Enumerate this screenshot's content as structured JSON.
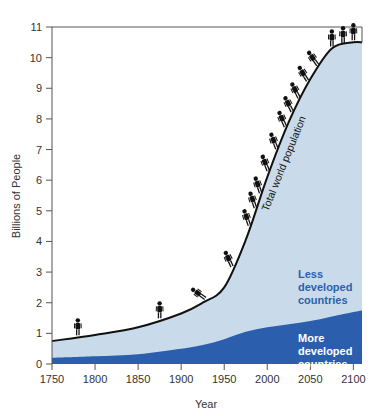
{
  "chart_data": {
    "type": "area",
    "title": "",
    "xlabel": "Year",
    "ylabel": "Billions of People",
    "xlim": [
      1750,
      2110
    ],
    "ylim": [
      0,
      11
    ],
    "xticks": [
      1750,
      1800,
      1850,
      1900,
      1950,
      2000,
      2050,
      2100
    ],
    "yticks": [
      0,
      1,
      2,
      3,
      4,
      5,
      6,
      7,
      8,
      9,
      10,
      11
    ],
    "grid": false,
    "legend": "inline labels",
    "x": [
      1750,
      1800,
      1850,
      1900,
      1925,
      1950,
      1975,
      2000,
      2025,
      2050,
      2075,
      2100,
      2110
    ],
    "series": [
      {
        "name": "More developed countries",
        "values": [
          0.2,
          0.25,
          0.32,
          0.5,
          0.62,
          0.81,
          1.05,
          1.2,
          1.3,
          1.4,
          1.55,
          1.7,
          1.75
        ],
        "color": "#2b5fae"
      },
      {
        "name": "Less developed countries",
        "values": [
          0.55,
          0.7,
          0.88,
          1.15,
          1.38,
          1.69,
          3.0,
          4.9,
          6.6,
          7.9,
          8.75,
          8.8,
          8.75
        ],
        "color": "#c9dbea"
      },
      {
        "name": "Total world population",
        "values": [
          0.75,
          0.95,
          1.2,
          1.65,
          2.0,
          2.5,
          4.05,
          6.1,
          7.9,
          9.3,
          10.3,
          10.5,
          10.5
        ],
        "color": "#111111"
      }
    ],
    "annotations": [
      "Total world population",
      "Less developed countries",
      "More developed countries"
    ],
    "person_icon_years": [
      1780,
      1875,
      1930,
      1960,
      1980,
      1987,
      1993,
      2002,
      2012,
      2022,
      2030,
      2038,
      2048,
      2060,
      2075,
      2088,
      2100
    ]
  },
  "labels": {
    "x_axis_title": "Year",
    "y_axis_title": "Billions of People",
    "total_curve": "Total world population",
    "less_developed": [
      "Less",
      "developed",
      "countries"
    ],
    "more_developed": [
      "More",
      "developed",
      "countries"
    ]
  },
  "colors": {
    "more_developed": "#2b5fae",
    "less_developed": "#c9dbea",
    "total_line": "#111111",
    "axis": "#555555",
    "less_label": "#2b5fae",
    "more_label": "#ffffff"
  }
}
